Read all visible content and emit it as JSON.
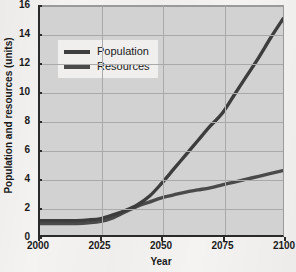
{
  "chart_data": {
    "type": "line",
    "title": "",
    "xlabel": "Year",
    "ylabel": "Population and resources (units)",
    "xlim": [
      2000,
      2100
    ],
    "ylim": [
      0,
      16
    ],
    "xticks": [
      2000,
      2025,
      2050,
      2075,
      2100
    ],
    "yticks": [
      0,
      2,
      4,
      6,
      8,
      10,
      12,
      14,
      16
    ],
    "grid": true,
    "legend_position": "upper-left",
    "x": [
      2000,
      2005,
      2010,
      2015,
      2020,
      2025,
      2030,
      2035,
      2040,
      2045,
      2050,
      2055,
      2060,
      2065,
      2070,
      2075,
      2080,
      2085,
      2090,
      2095,
      2100
    ],
    "series": [
      {
        "name": "Population",
        "color": "#3d3d3d",
        "values": [
          1.0,
          1.0,
          1.0,
          1.0,
          1.05,
          1.15,
          1.4,
          1.7,
          2.1,
          2.7,
          3.6,
          4.6,
          5.6,
          6.6,
          7.6,
          8.5,
          9.8,
          11.1,
          12.4,
          13.8,
          15.1
        ]
      },
      {
        "name": "Resources",
        "color": "#4a4a4a",
        "values": [
          0.8,
          0.8,
          0.8,
          0.8,
          0.85,
          0.95,
          1.2,
          1.6,
          2.0,
          2.3,
          2.6,
          2.8,
          3.0,
          3.15,
          3.3,
          3.5,
          3.7,
          3.9,
          4.1,
          4.3,
          4.5
        ]
      }
    ]
  },
  "legend": {
    "entries": [
      {
        "label": "Population"
      },
      {
        "label": "Resources"
      }
    ]
  },
  "axes": {
    "x_title": "Year",
    "y_title": "Population and resources (units)",
    "x_tick_labels": [
      "2000",
      "2025",
      "2050",
      "2075",
      "2100"
    ],
    "y_tick_labels": [
      "0",
      "2",
      "4",
      "6",
      "8",
      "10",
      "12",
      "14",
      "16"
    ]
  },
  "colors": {
    "plot_background": "#d2d2d2",
    "figure_background": "#f4f3f1",
    "gridline": "#a9a9a9",
    "axis": "#2a2a2a",
    "population_line": "#3d3d3d",
    "resources_line": "#4a4a4a",
    "legend_background": "#f0efee",
    "text": "#1a1a1a"
  }
}
